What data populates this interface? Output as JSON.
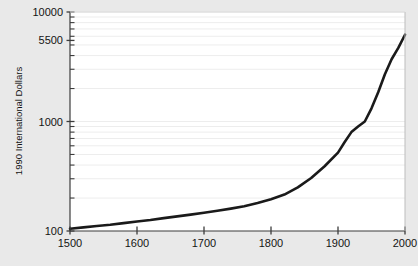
{
  "chart_data": {
    "type": "line",
    "title": "",
    "xlabel": "",
    "ylabel": "1990 International Dollars",
    "yscale": "log",
    "xscale": "linear",
    "xlim": [
      1500,
      2000
    ],
    "ylim": [
      100,
      10000
    ],
    "grid": true,
    "legend": "none",
    "line_color": "#1a1a1a",
    "plot_bg": "#ffffff",
    "figure_bg": "#e9e9e9",
    "grid_color": "#ededed",
    "axis_color": "#3c3c3c",
    "xticks": [
      1500,
      1600,
      1700,
      1800,
      1900,
      2000
    ],
    "xtick_labels": [
      "1500",
      "1600",
      "1700",
      "1800",
      "1900",
      "2000"
    ],
    "yticks": [
      100,
      1000,
      5500,
      10000
    ],
    "ytick_labels": [
      "100",
      "1000",
      "5500",
      "10000"
    ],
    "y_minor_ticks": [
      200,
      300,
      400,
      500,
      600,
      700,
      800,
      900,
      2000,
      3000,
      4000,
      5000,
      6000,
      7000,
      8000,
      9000
    ],
    "series": [
      {
        "name": "GDP per capita",
        "x": [
          1500,
          1520,
          1540,
          1560,
          1580,
          1600,
          1620,
          1640,
          1660,
          1680,
          1700,
          1720,
          1740,
          1760,
          1780,
          1800,
          1820,
          1840,
          1860,
          1880,
          1900,
          1910,
          1920,
          1930,
          1940,
          1950,
          1960,
          1970,
          1980,
          1990,
          2000
        ],
        "y": [
          105,
          108,
          111,
          114,
          118,
          122,
          126,
          131,
          136,
          141,
          147,
          153,
          160,
          168,
          180,
          195,
          215,
          250,
          305,
          390,
          520,
          650,
          800,
          900,
          1000,
          1320,
          1850,
          2700,
          3700,
          4700,
          6200
        ]
      }
    ]
  }
}
